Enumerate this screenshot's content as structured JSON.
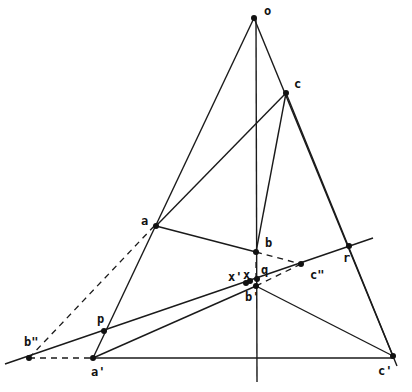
{
  "diagram": {
    "type": "projective-geometry-construction",
    "points": [
      {
        "id": "o",
        "label": "o",
        "x": 254,
        "y": 18,
        "lx": 264,
        "ly": 15
      },
      {
        "id": "c",
        "label": "c",
        "x": 286,
        "y": 93,
        "lx": 294,
        "ly": 88
      },
      {
        "id": "a",
        "label": "a",
        "x": 156,
        "y": 226,
        "lx": 141,
        "ly": 225
      },
      {
        "id": "b",
        "label": "b",
        "x": 256,
        "y": 252,
        "lx": 265,
        "ly": 247
      },
      {
        "id": "r",
        "label": "r",
        "x": 349,
        "y": 246,
        "lx": 343,
        "ly": 262
      },
      {
        "id": "c2",
        "label": "c\"",
        "x": 301,
        "y": 264,
        "lx": 310,
        "ly": 279
      },
      {
        "id": "q",
        "label": "q",
        "x": 257,
        "y": 279,
        "lx": 261,
        "ly": 274
      },
      {
        "id": "x",
        "label": "x",
        "x": 250,
        "y": 281,
        "lx": 243,
        "ly": 279
      },
      {
        "id": "x1",
        "label": "x'",
        "x": 246,
        "y": 283,
        "lx": 228,
        "ly": 281
      },
      {
        "id": "b1",
        "label": "b'",
        "x": 256,
        "y": 286,
        "lx": 245,
        "ly": 301
      },
      {
        "id": "p",
        "label": "p",
        "x": 104,
        "y": 331,
        "lx": 97,
        "ly": 323
      },
      {
        "id": "b2",
        "label": "b\"",
        "x": 29,
        "y": 358,
        "lx": 24,
        "ly": 346
      },
      {
        "id": "a1",
        "label": "a'",
        "x": 93,
        "y": 358,
        "lx": 91,
        "ly": 376
      },
      {
        "id": "c1",
        "label": "c'",
        "x": 393,
        "y": 356,
        "lx": 378,
        "ly": 375
      }
    ],
    "solid_lines": [
      {
        "name": "line-o-a1",
        "x1": 254,
        "y1": 18,
        "x2": 93,
        "y2": 358
      },
      {
        "name": "line-o-c1",
        "x1": 254,
        "y1": 18,
        "x2": 397,
        "y2": 366
      },
      {
        "name": "line-vertical-axis",
        "x1": 256,
        "y1": 18,
        "x2": 257,
        "y2": 382
      },
      {
        "name": "line-a-c",
        "x1": 156,
        "y1": 226,
        "x2": 286,
        "y2": 93
      },
      {
        "name": "line-c-b",
        "x1": 286,
        "y1": 93,
        "x2": 256,
        "y2": 252
      },
      {
        "name": "line-a-b",
        "x1": 156,
        "y1": 226,
        "x2": 256,
        "y2": 252
      },
      {
        "name": "line-a1-c1",
        "x1": 93,
        "y1": 358,
        "x2": 393,
        "y2": 358
      },
      {
        "name": "line-a1-b1",
        "x1": 93,
        "y1": 358,
        "x2": 256,
        "y2": 286
      },
      {
        "name": "line-b1-c1",
        "x1": 256,
        "y1": 286,
        "x2": 393,
        "y2": 356
      },
      {
        "name": "line-axis-b2-r",
        "x1": 5,
        "y1": 364,
        "x2": 373,
        "y2": 238
      },
      {
        "name": "line-c-c1",
        "x1": 286,
        "y1": 93,
        "x2": 393,
        "y2": 356
      }
    ],
    "dashed_lines": [
      {
        "name": "dash-b2-a",
        "x1": 29,
        "y1": 358,
        "x2": 158,
        "y2": 222
      },
      {
        "name": "dash-b2-a1",
        "x1": 29,
        "y1": 358,
        "x2": 93,
        "y2": 358
      },
      {
        "name": "dash-b-c2",
        "x1": 256,
        "y1": 252,
        "x2": 301,
        "y2": 264
      },
      {
        "name": "dash-b1-c2",
        "x1": 256,
        "y1": 286,
        "x2": 301,
        "y2": 264
      },
      {
        "name": "dash-vertical-q",
        "x1": 256,
        "y1": 262,
        "x2": 256,
        "y2": 278
      }
    ]
  }
}
